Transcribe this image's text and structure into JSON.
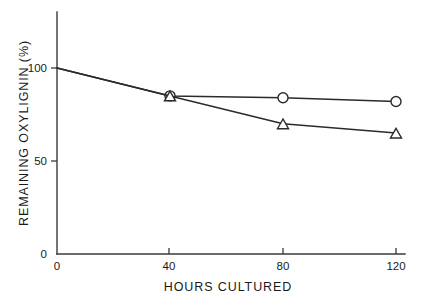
{
  "chart_data": {
    "type": "line",
    "title": "",
    "subtitle": "",
    "xlabel": "HOURS CULTURED",
    "ylabel": "REMAINING OXYLIGNIN (%)",
    "x": [
      0,
      40,
      80,
      120
    ],
    "xlim": [
      0,
      120
    ],
    "ylim": [
      0,
      108
    ],
    "xticks": [
      0,
      40,
      80,
      120
    ],
    "xtick_labels": [
      "0",
      "40",
      "80",
      "120"
    ],
    "yticks": [
      0,
      50,
      100
    ],
    "ytick_labels": [
      "0",
      "50",
      "100"
    ],
    "grid": false,
    "legend": "none",
    "series": [
      {
        "name": "circle-series",
        "marker": "circle",
        "values": [
          100,
          85,
          84,
          82
        ]
      },
      {
        "name": "triangle-series",
        "marker": "triangle",
        "values": [
          100,
          85,
          70,
          65
        ]
      }
    ],
    "annotations": []
  },
  "axes": {
    "x_title": "HOURS CULTURED",
    "y_title": "REMAINING OXYLIGNIN (%)",
    "x_tick_0": "0",
    "x_tick_1": "40",
    "x_tick_2": "80",
    "x_tick_3": "120",
    "y_tick_0": "0",
    "y_tick_1": "50",
    "y_tick_2": "100"
  }
}
